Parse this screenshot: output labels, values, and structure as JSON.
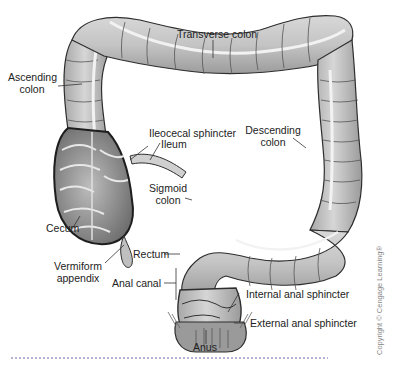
{
  "figure": {
    "labels": {
      "transverse_colon": "Transverse colon",
      "ascending_colon_1": "Ascending",
      "ascending_colon_2": "colon",
      "ileocecal_sphincter": "Ileocecal sphincter",
      "ileum": "Ileum",
      "descending_colon_1": "Descending",
      "descending_colon_2": "colon",
      "sigmoid_colon_1": "Sigmoid",
      "sigmoid_colon_2": "colon",
      "cecum": "Cecum",
      "vermiform_appendix_1": "Vermiform",
      "vermiform_appendix_2": "appendix",
      "rectum": "Rectum",
      "anal_canal": "Anal canal",
      "internal_anal_sphincter": "Internal anal sphincter",
      "external_anal_sphincter": "External anal sphincter",
      "anus": "Anus"
    },
    "copyright": "Copyright © Cengage Learning®",
    "colors": {
      "organ_fill": "#c9c9c9",
      "organ_light": "#e6e6e6",
      "organ_dark": "#8a8a8a",
      "outline": "#2e2e2e",
      "dotted_rule": "#b9b3d6"
    }
  }
}
